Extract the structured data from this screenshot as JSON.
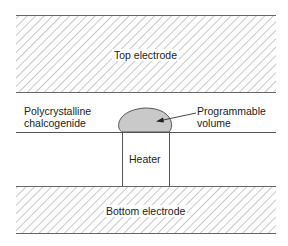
{
  "diagram": {
    "type": "phase-change memory cell cross-section",
    "labels": {
      "top_electrode": "Top electrode",
      "chalcogenide_line1": "Polycrystalline",
      "chalcogenide_line2": "chalcogenide",
      "programmable_line1": "Programmable",
      "programmable_line2": "volume",
      "heater": "Heater",
      "bottom_electrode": "Bottom electrode"
    },
    "colors": {
      "line": "#555555",
      "hatch": "#b0b0b0",
      "programmable_fill": "#c9c9c9",
      "background": "#ffffff"
    }
  }
}
